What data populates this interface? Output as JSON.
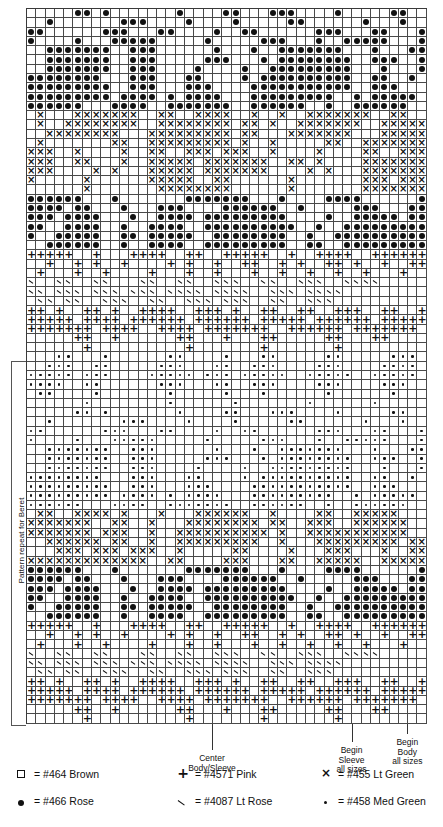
{
  "chart_data": {
    "type": "table",
    "columns": 43,
    "rows": 77,
    "cell_px": 9.3,
    "symbol_legend_keys": [
      "blank",
      "dot",
      "plus",
      "backslash",
      "x",
      "smalldot"
    ],
    "grid": [
      ".....dd.d.......d....dd...ddd....d.....dd..",
      "..d.......ddd....d....d.....dd......d...d..",
      "dd......ddd...dd....d..dd......ddd...dd...d",
      "d....d...ddddd.....d.....ddd...d..ddddd...d",
      "..ddddddd..ddd......d...d..ddddddd...d...dd",
      "..ddddddd..ddd.....ddd...d.dddddddd..ddd..d",
      "..ddddddd..ddd....d....d..ddddddddd...d...d",
      "dddddddd...ddd...dd....d.dddddddddd..dd..d.",
      "ddddddddd..ddd...ddd....ddddddddddd..ddd...",
      "ddddddddd.dddd.d.dddd...ddddddddd..d.ddddd.",
      "dddddd...dddd..ddddddd..dddddd..d..dddddd..",
      ".x...xxxxxxx..xx..xxxx..x..x..xxxxxxx..xx..",
      ".x..xxxxxxxx..xxxxxxxx.xx.x..xxxxxxx..xxxxx",
      "..xxxxxxxx...xxxxxxxxx.xx...xxxxxxx...xxxxx",
      ".x.......xx..xxxxxxxxx.x..x.....xx..xxxxxxx",
      "xxx..x....x..xx..xxx.xxx..x....x....xx..xxx",
      "xxx..xx...x..xxxxx.xxxxxxx..xx.x....xxxxxxx",
      "xxx....x.x...xxxxx.xxxxxxx....x.x...xxxxxxx",
      "x.....x......xxxxx..xx......x.......xxx.xxx",
      "......x.......xxxxxxxx......x.......xxxxxxx",
      "dddddd...d.......ddddddd...d....dddd......d",
      "dddd.dd...d...ddd....dddddd..d.....ddd...dd",
      "ddd.dddd...d..dddd.ddddddddd....d..ddddd.dd",
      "dd..dddd..d..dddd..dddddddddd..d..ddddddddd",
      "d..ddddd..dd.ddddd..dddddddd..d..dddddddddd",
      "..dddddd..d..dddd..ddddddddd..dd..ddddddddd",
      "+++++..+...++++..++..+++++..+..++++..++++++",
      "..+..+.+..+....+.+..+..++..+.+..++.+..+..++",
      ".+...+..+....+...+..+...+..+..+..+..+...+..",
      "\\..\\\\..\\\\...\\\\..\\\\..\\\\\\..\\\\..\\\\\\..\\\\\\\\",
      "\\\\.\\\\\\.\\\\\\.\\\\\\.\\\\\\\\.\\\\\\\\..\\\\\\.\\\\\\\\",
      ".\\\\.\\\\..\\\\\\..\\\\..\\\\\\.\\\\\\..\\\\..\\\\\\.",
      "++.+..++.+..++++..+++.+..++..++..+++..++..+",
      "+++++.++++.++++++.++++++.+++++.++++++.+++++",
      "+++++++.++++..++++.+++++++..++++++.+++++++.",
      ".....++..+......++...+...++.....++...++....",
      "......+..........+.......+.......+.........",
      "...dd...d......dd....d...dd.....dd.....ddd.",
      "..ddd..dd.....ddd...dd..ddd....ddd....dddd.",
      "ddddd.ddd....ddddd.ddd.ddddd..ddddd..ddddd.",
      "dddd..dd......ddd...dd..ddd....ddd....ddd..",
      ".dd....d.......d.....d...d......d......d...",
      "......d........d......d.......d......d.....",
      ".....dd.d.......d....dd...ddd....d.....dd..",
      "..d.......ddd....d....d.....dd......d...d..",
      "dd......ddd...dd....d..dd......ddd...dd...d",
      "d....d...ddddd.....d.....ddd...d..ddddd...d",
      "..ddddddd..ddd......d...d..ddddddd...d...dd",
      "..ddddddd..ddd.....ddd...d.dddddddd..ddd..d",
      "..ddddddd..ddd....d....d..ddddddddd...d...d",
      "dddddddd...ddd...dd....d.dddddddddd..dd..d.",
      "ddddddddd..ddd...ddd....ddddddddddd..ddd...",
      "ddddddddd.dddd.d.dddd...ddddddddd..d.ddddd.",
      "dddddd...dddd..ddddddd..dddddd..d..dddddd..",
      ".xx..xxxx.x...x...xxxxxx..x....xx..xxxxx...",
      "xxxxxxx..xx..x...xxxxxxxx.xx..xxx..xxxxxx..",
      "xxxxxxx.xxx..x..xxxxxxxxxx.x..xxxxxxxxxxx..",
      "..xxxxxx.xx..x..xxxxxxxxx..x...xxxxxxxxx.xx",
      "...xxx.xxx.xxx..x.....xx....x...xxx...x..xx",
      "xxxxxxxxxxxxx..xx....xxx...xx..xxxxx..xxxxx",
      "dddddd...d.......ddddddd...d....dddd......d",
      "dddd.dd...d...ddd....dddddd..d.....ddd...dd",
      "ddd.dddd...d..dddd.ddddddddd....d..ddddd.dd",
      "dd..dddd..d..dddd..dddddddddd..d..ddddddddd",
      "d..ddddd..dd.ddddd..dddddddd..d..dddddddddd",
      "..dddddd..d..dddd..ddddddddd..dd..ddddddddd",
      "+++++..+...++++..++..+++++..+..++++..++++++",
      "..+..+.+..+....+.+..+..++..+.+..++.+..+..++",
      ".+...+..+....+...+..+...+..+..+..+..+...+..",
      "\\..\\\\..\\\\...\\\\..\\\\..\\\\\\..\\\\..\\\\\\..\\\\\\\\",
      "\\\\.\\\\\\.\\\\\\.\\\\\\.\\\\\\\\.\\\\\\\\..\\\\\\.\\\\\\\\",
      ".\\\\.\\\\..\\\\\\..\\\\..\\\\\\.\\\\\\..\\\\..\\\\\\.",
      "++.+..++.+..++++..+++.+..++..++..+++..++..+",
      "+++++.++++.++++++.++++++.+++++.++++++.+++++",
      "+++++++.++++..++++.+++++++..++++++.+++++++.",
      ".....++..+......++...+...++.....++...++....",
      "......+..........+.......+.......+........."
    ]
  },
  "annotations": {
    "repeat_label": "Pattern repeat for Beret",
    "markers": [
      {
        "label": "Center\nBody/Sleeve"
      },
      {
        "label": "Begin\nSleeve\nall sizes"
      },
      {
        "label": "Begin\nBody\nall sizes"
      }
    ]
  },
  "legend": {
    "entries": [
      {
        "symbol": "square",
        "equals": "=",
        "text": "#464 Brown"
      },
      {
        "symbol": "plus",
        "equals": "=",
        "text": "#4571 Pink"
      },
      {
        "symbol": "x",
        "equals": "=",
        "text": "#455 Lt Green"
      },
      {
        "symbol": "dot",
        "equals": "=",
        "text": "#466 Rose"
      },
      {
        "symbol": "backslash",
        "equals": "=",
        "text": "#4087 Lt Rose"
      },
      {
        "symbol": "smalldot",
        "equals": "=",
        "text": "#458 Med Green"
      }
    ]
  }
}
